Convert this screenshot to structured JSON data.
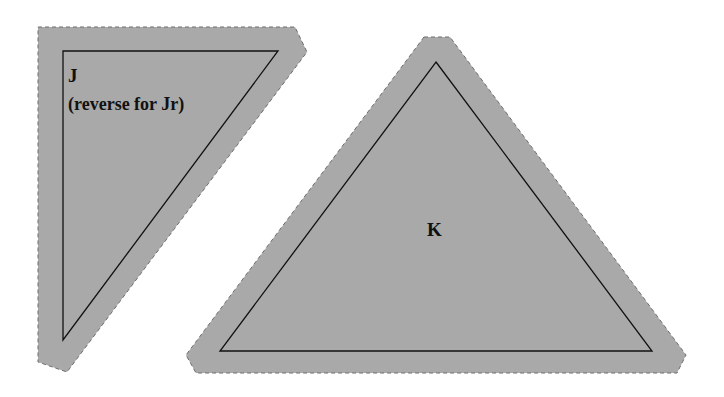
{
  "pieces": [
    {
      "id": "J",
      "label": "J",
      "note": "(reverse for Jr)",
      "outer_points": "38,27 295,27 307,52 67,372 38,362",
      "inner_points": "63,51 278,51 63,340"
    },
    {
      "id": "K",
      "label": "K",
      "outer_points": "424,37 450,37 686,355 677,373 196,373 186,355",
      "inner_points": "436,62 652,351 220,351"
    }
  ],
  "colors": {
    "fabric_fill": "#a9a9a9",
    "seam_allowance_stroke": "#6e6e6e",
    "sewing_line": "#111111",
    "background": "#ffffff"
  }
}
